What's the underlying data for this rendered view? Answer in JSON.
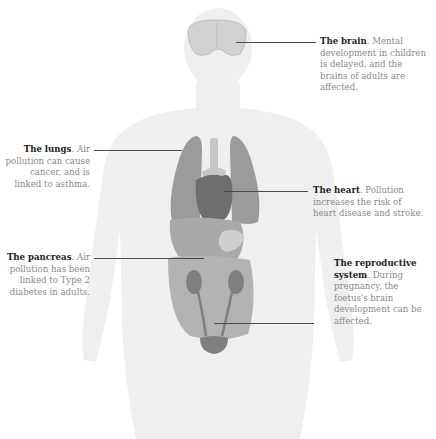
{
  "diagram": {
    "colors": {
      "body": "#efefef",
      "lungs": "#9b9b9b",
      "heart": "#6e6e6e",
      "trachea": "#c6c6c6",
      "organs_light": "#bdbdbd",
      "organs_mid": "#a9a9a9",
      "kidneys": "#7f7f7f",
      "bladder": "#808080",
      "brain": "#d2d2d2",
      "leader_line": "#4a4a4a",
      "text_body": "#8a8a8a",
      "text_heading": "#1e1e1e"
    },
    "callouts": [
      {
        "id": "brain",
        "heading": "The brain",
        "text": ". Mental development in children is delayed, and the brains of adults are affected."
      },
      {
        "id": "lungs",
        "heading": "The lungs",
        "text": ". Air pollution can cause cancer, and is linked to asthma."
      },
      {
        "id": "heart",
        "heading": "The heart",
        "text": ". Pollution increases the risk of heart disease and stroke."
      },
      {
        "id": "pancreas",
        "heading": "The pancreas",
        "text": ". Air pollution has been linked to Type 2 diabetes in adults."
      },
      {
        "id": "reproductive",
        "heading": "The reproductive system",
        "text": ". During pregnancy, the foetus's brain development can be affected."
      }
    ]
  }
}
